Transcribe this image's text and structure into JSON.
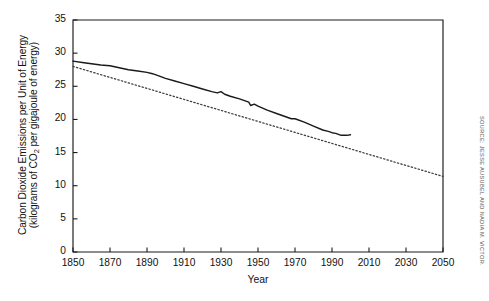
{
  "chart_data": {
    "type": "line",
    "title": "",
    "xlabel": "Year",
    "ylabel_line1": "Carbon Dioxide Emissions per Unit of Energy",
    "ylabel_line2_pre": "(kilograms of CO",
    "ylabel_line2_sub": "2",
    "ylabel_line2_post": " per gigajoule of energy)",
    "xlim": [
      1850,
      2050
    ],
    "ylim": [
      0,
      35
    ],
    "grid": false,
    "legend": "none",
    "xticks": [
      1850,
      1870,
      1890,
      1910,
      1930,
      1950,
      1970,
      1990,
      2010,
      2030,
      2050
    ],
    "yticks": [
      0,
      5,
      10,
      15,
      20,
      25,
      30,
      35
    ],
    "series": [
      {
        "name": "Observed carbon intensity",
        "style": "solid",
        "color": "#1a1a1a",
        "x": [
          1850,
          1855,
          1860,
          1865,
          1870,
          1875,
          1880,
          1885,
          1890,
          1893,
          1896,
          1900,
          1905,
          1910,
          1915,
          1920,
          1925,
          1928,
          1930,
          1932,
          1935,
          1940,
          1945,
          1946,
          1948,
          1950,
          1955,
          1960,
          1965,
          1968,
          1970,
          1975,
          1980,
          1985,
          1988,
          1990,
          1992,
          1995,
          1998,
          2000
        ],
        "values": [
          28.8,
          28.6,
          28.4,
          28.2,
          28.1,
          27.8,
          27.5,
          27.3,
          27.1,
          26.9,
          26.6,
          26.2,
          25.8,
          25.4,
          25.0,
          24.6,
          24.2,
          24.0,
          24.2,
          23.8,
          23.5,
          23.1,
          22.6,
          22.1,
          22.3,
          22.0,
          21.4,
          20.9,
          20.4,
          20.1,
          20.1,
          19.6,
          19.0,
          18.4,
          18.2,
          18.0,
          17.9,
          17.6,
          17.6,
          17.7
        ]
      },
      {
        "name": "Long-term trend",
        "style": "dotted",
        "color": "#3c3c3c",
        "x": [
          1850,
          2050
        ],
        "values": [
          28.0,
          11.4
        ]
      }
    ],
    "source_note": "SOURCE: JESSE AUSUBEL AND NADIA M. VICTOR."
  },
  "axis": {
    "frame_color": "#1a1a1a"
  }
}
